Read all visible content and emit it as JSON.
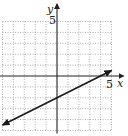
{
  "chart_data": {
    "type": "line",
    "title": "",
    "xlabel": "x",
    "ylabel": "y",
    "xlim": [
      -5,
      5
    ],
    "ylim": [
      -5,
      5
    ],
    "grid": true,
    "grid_style": "dotted",
    "tick_labels": {
      "x": [
        "5"
      ],
      "y": [
        "5"
      ]
    },
    "series": [
      {
        "name": "line",
        "equation": "y = x/2 - 2",
        "slope": 0.5,
        "intercept": -2,
        "x": [
          -5,
          5
        ],
        "y": [
          -4.5,
          0.5
        ],
        "arrows": "both"
      }
    ]
  },
  "labels": {
    "x_axis": "x",
    "y_axis": "y",
    "x_tick": "5",
    "y_tick": "5"
  },
  "colors": {
    "axis": "#222222",
    "grid": "#9a9a9a",
    "line": "#1a1a1a"
  }
}
